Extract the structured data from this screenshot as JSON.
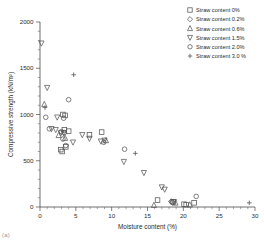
{
  "figure": {
    "caption": "(a)",
    "width": 264,
    "height": 247
  },
  "axes": {
    "x": {
      "label": "Moisture content (%)",
      "min": 0,
      "max": 30,
      "ticks": [
        0,
        5,
        10,
        15,
        20,
        25,
        30
      ],
      "minor_tick_step": 1
    },
    "y": {
      "label": "Compressive strength  (kN/m²)",
      "min": 0,
      "max": 2000,
      "ticks": [
        0,
        500,
        1000,
        1500,
        2000
      ],
      "minor_tick_step": 100
    },
    "grid": false
  },
  "legend": {
    "position": "top-right",
    "entries": [
      {
        "marker": "square",
        "label": "Straw content 0%"
      },
      {
        "marker": "diamond",
        "label": "Straw content 0.2%"
      },
      {
        "marker": "triangle-up",
        "label": "Straw content 0.6%"
      },
      {
        "marker": "triangle-down",
        "label": "Straw content 1.5%"
      },
      {
        "marker": "circle",
        "label": "Straw content 2.0%"
      },
      {
        "marker": "plus",
        "label": "Straw content 3.0 %"
      }
    ]
  },
  "chart_data": {
    "type": "scatter",
    "title": "",
    "xlabel": "Moisture content (%)",
    "ylabel": "Compressive strength  (kN/m²)",
    "xlim": [
      0,
      30
    ],
    "ylim": [
      0,
      2000
    ],
    "series": [
      {
        "name": "Straw content 0%",
        "marker": "square",
        "points": [
          [
            3.2,
            1000
          ],
          [
            3.5,
            990
          ],
          [
            3.4,
            835
          ],
          [
            2.9,
            620
          ],
          [
            3.1,
            600
          ],
          [
            3.6,
            650
          ],
          [
            8.6,
            810
          ],
          [
            6.9,
            780
          ],
          [
            16.4,
            75
          ],
          [
            18.6,
            55
          ],
          [
            20.1,
            30
          ],
          [
            20.4,
            25
          ],
          [
            21.5,
            45
          ],
          [
            4.0,
            820
          ]
        ]
      },
      {
        "name": "Straw content 0.2%",
        "marker": "diamond",
        "points": [
          [
            18.3,
            60
          ],
          [
            18.5,
            50
          ]
        ]
      },
      {
        "name": "Straw content 0.6%",
        "marker": "triangle-up",
        "points": [
          [
            0.6,
            1110
          ],
          [
            2.6,
            775
          ],
          [
            3.5,
            745
          ],
          [
            9.2,
            720
          ],
          [
            15.9,
            20
          ],
          [
            18.9,
            45
          ],
          [
            20.9,
            25
          ]
        ]
      },
      {
        "name": "Straw content 1.5%",
        "marker": "triangle-down",
        "points": [
          [
            0.2,
            1770
          ],
          [
            1.0,
            1290
          ],
          [
            2.4,
            970
          ],
          [
            1.6,
            845
          ],
          [
            2.2,
            835
          ],
          [
            2.9,
            800
          ],
          [
            3.3,
            800
          ],
          [
            4.6,
            700
          ],
          [
            5.9,
            780
          ],
          [
            6.9,
            740
          ],
          [
            8.5,
            710
          ],
          [
            9.0,
            720
          ],
          [
            11.7,
            490
          ],
          [
            14.5,
            370
          ],
          [
            17.0,
            215
          ],
          [
            17.4,
            190
          ],
          [
            18.7,
            55
          ]
        ]
      },
      {
        "name": "Straw content 2.0%",
        "marker": "circle",
        "points": [
          [
            0.8,
            970
          ],
          [
            1.3,
            845
          ],
          [
            4.0,
            1160
          ],
          [
            3.3,
            960
          ],
          [
            3.0,
            815
          ],
          [
            3.4,
            805
          ],
          [
            3.2,
            735
          ],
          [
            3.6,
            665
          ],
          [
            8.9,
            700
          ],
          [
            11.8,
            625
          ],
          [
            18.4,
            55
          ],
          [
            21.8,
            115
          ]
        ]
      },
      {
        "name": "Straw content 3.0 %",
        "marker": "plus",
        "points": [
          [
            4.7,
            1430
          ],
          [
            0.7,
            1075
          ],
          [
            13.3,
            580
          ],
          [
            29.2,
            45
          ]
        ]
      }
    ]
  }
}
